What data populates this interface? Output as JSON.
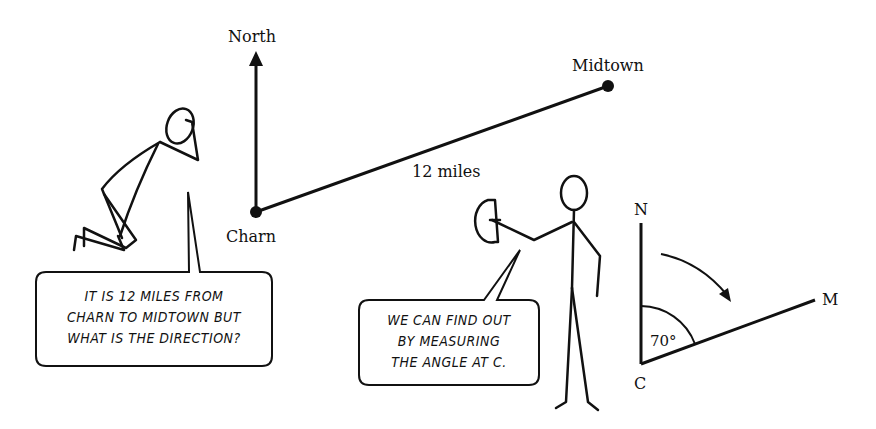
{
  "labels": {
    "north": "North",
    "midtown": "Midtown",
    "charn": "Charn",
    "distance": "12 miles",
    "compass_n": "N",
    "compass_m": "M",
    "compass_c": "C",
    "angle": "70°"
  },
  "bubbles": {
    "left": {
      "lines": [
        "IT IS 12 MILES FROM",
        "CHARN TO MIDTOWN BUT",
        "WHAT IS THE DIRECTION?"
      ]
    },
    "right": {
      "lines": [
        "WE CAN FIND OUT",
        "BY MEASURING",
        "THE ANGLE AT C."
      ]
    }
  },
  "diagram": {
    "distance_miles": 12,
    "bearing_degrees": 70,
    "from": "Charn",
    "to": "Midtown"
  },
  "colors": {
    "ink": "#111111",
    "background": "#ffffff"
  }
}
